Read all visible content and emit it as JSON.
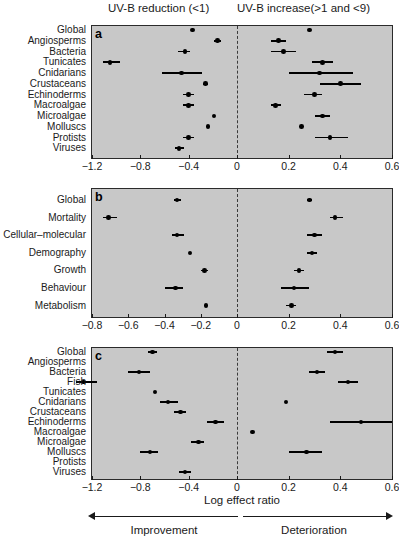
{
  "headers": {
    "left": "UV-B reduction (<1)",
    "right": "UV-B increase(>1 and <9)"
  },
  "axis_title": "Log effect ratio",
  "direction": {
    "left_label": "Improvement",
    "right_label": "Deterioration"
  },
  "chart_data": [
    {
      "type": "scatter",
      "panel": "a",
      "title": "",
      "xlabel": "",
      "ylabel": "",
      "xlim": [
        -1.2,
        0.6
      ],
      "xticks": [
        -1.2,
        -0.8,
        -0.4,
        0,
        0.2,
        0.4,
        0.6
      ],
      "xticklabels": [
        "−1.2",
        "−0.8",
        "−0.4",
        "0",
        "0.2",
        "0.4",
        "0.6"
      ],
      "grid": false,
      "zero_reference": 0,
      "categories": [
        "Global",
        "Angiosperms",
        "Bacteria",
        "Tunicates",
        "Cnidarians",
        "Crustaceans",
        "Echinoderms",
        "Macroalgae",
        "Microalgae",
        "Molluscs",
        "Protists",
        "Viruses"
      ],
      "series": [
        {
          "name": "UV-B reduction (<1)",
          "values": [
            -0.37,
            -0.16,
            -0.43,
            -1.05,
            -0.46,
            -0.26,
            -0.4,
            -0.4,
            -0.19,
            -0.24,
            -0.4,
            -0.48
          ],
          "ci_low": [
            -0.37,
            -0.19,
            -0.49,
            -1.11,
            -0.62,
            -0.28,
            -0.45,
            -0.45,
            -0.19,
            -0.24,
            -0.45,
            -0.51
          ],
          "ci_high": [
            -0.37,
            -0.13,
            -0.39,
            -0.97,
            -0.29,
            -0.24,
            -0.36,
            -0.36,
            -0.19,
            -0.24,
            -0.36,
            -0.44
          ]
        },
        {
          "name": "UV-B increase(>1 and <9)",
          "values": [
            0.28,
            0.16,
            0.18,
            0.33,
            0.32,
            0.4,
            0.3,
            0.15,
            0.33,
            0.25,
            0.36,
            null
          ],
          "ci_low": [
            0.28,
            0.13,
            0.13,
            0.29,
            0.2,
            0.32,
            0.26,
            0.13,
            0.3,
            0.25,
            0.3,
            null
          ],
          "ci_high": [
            0.28,
            0.19,
            0.23,
            0.37,
            0.45,
            0.48,
            0.33,
            0.17,
            0.36,
            0.25,
            0.43,
            null
          ]
        }
      ]
    },
    {
      "type": "scatter",
      "panel": "b",
      "title": "",
      "xlabel": "",
      "ylabel": "",
      "xlim": [
        -0.8,
        0.6
      ],
      "xticks": [
        -0.8,
        -0.6,
        -0.4,
        -0.2,
        0,
        0.2,
        0.4,
        0.6
      ],
      "xticklabels": [
        "−0.8",
        "−0.6",
        "−0.4",
        "−0.2",
        "0",
        "0.2",
        "0.4",
        "0.6"
      ],
      "grid": false,
      "zero_reference": 0,
      "categories": [
        "Global",
        "Mortality",
        "Cellular–molecular",
        "Demography",
        "Growth",
        "Behaviour",
        "Metabolism"
      ],
      "series": [
        {
          "name": "UV-B reduction (<1)",
          "values": [
            -0.33,
            -0.71,
            -0.33,
            -0.26,
            -0.18,
            -0.34,
            -0.17
          ],
          "ci_low": [
            -0.35,
            -0.74,
            -0.36,
            -0.26,
            -0.2,
            -0.4,
            -0.17
          ],
          "ci_high": [
            -0.31,
            -0.66,
            -0.29,
            -0.26,
            -0.16,
            -0.3,
            -0.17
          ]
        },
        {
          "name": "UV-B increase(>1 and <9)",
          "values": [
            0.28,
            0.38,
            0.3,
            0.29,
            0.24,
            0.22,
            0.21
          ],
          "ci_low": [
            0.27,
            0.36,
            0.27,
            0.27,
            0.22,
            0.17,
            0.19
          ],
          "ci_high": [
            0.29,
            0.41,
            0.33,
            0.31,
            0.26,
            0.28,
            0.23
          ]
        }
      ]
    },
    {
      "type": "scatter",
      "panel": "c",
      "title": "",
      "xlabel": "Log effect ratio",
      "ylabel": "",
      "xlim": [
        -1.2,
        0.6
      ],
      "xticks": [
        -1.2,
        -0.8,
        -0.4,
        0,
        0.2,
        0.4,
        0.6
      ],
      "xticklabels": [
        "−1.2",
        "−0.8",
        "−0.4",
        "0",
        "0.2",
        "0.4",
        "0.6"
      ],
      "grid": false,
      "zero_reference": 0,
      "categories": [
        "Global",
        "Angiosperms",
        "Bacteria",
        "Fish",
        "Tunicates",
        "Cnidarians",
        "Crustaceans",
        "Echinoderms",
        "Macroalgae",
        "Microalgae",
        "Molluscs",
        "Protists",
        "Viruses"
      ],
      "series": [
        {
          "name": "UV-B reduction (<1)",
          "values": [
            -0.7,
            null,
            -0.81,
            -1.27,
            -0.68,
            -0.57,
            -0.47,
            -0.18,
            null,
            -0.32,
            -0.72,
            null,
            -0.43
          ],
          "ci_low": [
            -0.74,
            null,
            -0.9,
            -1.33,
            -0.68,
            -0.64,
            -0.52,
            -0.25,
            null,
            -0.38,
            -0.8,
            null,
            -0.48
          ],
          "ci_high": [
            -0.66,
            null,
            -0.72,
            -1.16,
            -0.68,
            -0.49,
            -0.42,
            -0.11,
            null,
            -0.27,
            -0.65,
            null,
            -0.38
          ]
        },
        {
          "name": "UV-B increase(>1 and <9)",
          "values": [
            0.38,
            null,
            0.31,
            0.43,
            null,
            0.19,
            null,
            0.48,
            0.06,
            null,
            0.27,
            null,
            null
          ],
          "ci_low": [
            0.35,
            null,
            0.28,
            0.39,
            null,
            0.19,
            null,
            0.36,
            0.06,
            null,
            0.2,
            null,
            null
          ],
          "ci_high": [
            0.41,
            null,
            0.34,
            0.47,
            null,
            0.19,
            null,
            0.6,
            0.06,
            null,
            0.33,
            null,
            null
          ]
        }
      ]
    }
  ]
}
